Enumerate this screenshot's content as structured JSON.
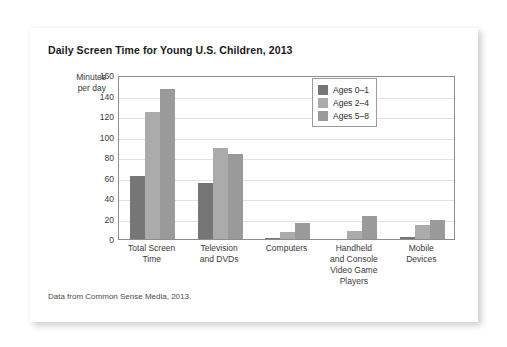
{
  "card": {
    "title": "Daily Screen Time for Young U.S. Children, 2013",
    "source_note": "Data from Common Sense Media, 2013."
  },
  "chart_data": {
    "type": "bar",
    "title": "Daily Screen Time for Young U.S. Children, 2013",
    "xlabel": "",
    "ylabel": "Minutes per day",
    "ylabel_line1": "Minutes",
    "ylabel_line2": "per day",
    "ylim": [
      0,
      160
    ],
    "ytick_step": 20,
    "yticks": [
      0,
      20,
      40,
      60,
      80,
      100,
      120,
      140,
      160
    ],
    "grid": true,
    "legend_position": "top-right",
    "categories": [
      "Total Screen Time",
      "Television and DVDs",
      "Computers",
      "Handheld and Console Video Game Players",
      "Mobile Devices"
    ],
    "category_lines": [
      [
        "Total Screen",
        "Time"
      ],
      [
        "Television",
        "and DVDs"
      ],
      [
        "Computers"
      ],
      [
        "Handheld",
        "and Console",
        "Video Game",
        "Players"
      ],
      [
        "Mobile",
        "Devices"
      ]
    ],
    "series": [
      {
        "name": "Ages 0–1",
        "color": "#767676",
        "values": [
          61,
          55,
          1,
          0,
          2
        ]
      },
      {
        "name": "Ages 2–4",
        "color": "#ababab",
        "values": [
          124,
          89,
          7,
          8,
          14
        ]
      },
      {
        "name": "Ages 5–8",
        "color": "#9a9a9a",
        "values": [
          146,
          83,
          16,
          22,
          19
        ]
      }
    ]
  }
}
